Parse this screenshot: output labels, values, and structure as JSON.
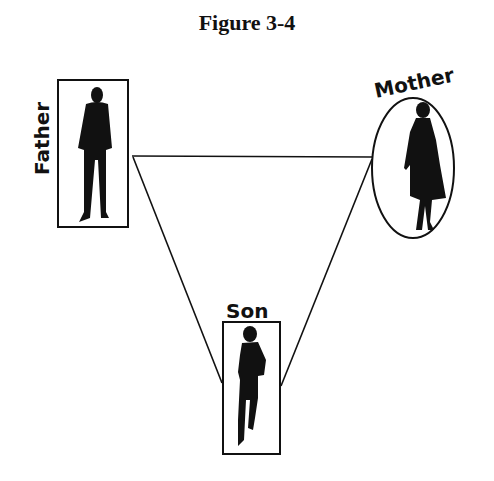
{
  "figure": {
    "title": "Figure 3-4",
    "nodes": [
      {
        "id": "father",
        "label": "Father",
        "shape": "rectangle",
        "position": "top-left"
      },
      {
        "id": "mother",
        "label": "Mother",
        "shape": "ellipse",
        "position": "top-right"
      },
      {
        "id": "son",
        "label": "Son",
        "shape": "rectangle",
        "position": "bottom-center"
      }
    ],
    "edges": [
      {
        "from": "father",
        "to": "mother"
      },
      {
        "from": "father",
        "to": "son"
      },
      {
        "from": "mother",
        "to": "son"
      }
    ],
    "colors": {
      "ink": "#111111",
      "background": "#ffffff"
    }
  }
}
